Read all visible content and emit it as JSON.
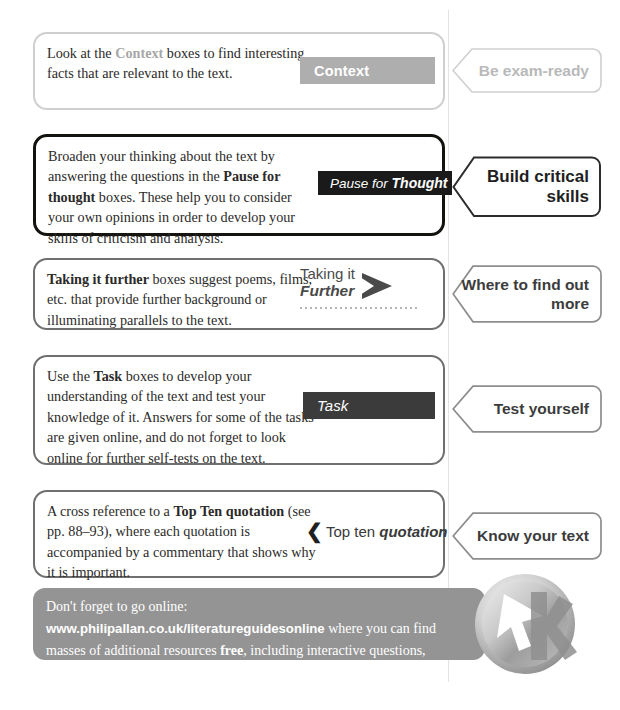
{
  "page": {
    "divider_color": "#e3e3e3",
    "accent_grey": "#aeaeae",
    "accent_dark": "#3b3b3b",
    "accent_black": "#1a1a1a"
  },
  "rows": [
    {
      "id": "context",
      "description_parts": {
        "lead": "Look at the ",
        "highlight": "Context",
        "rest": " boxes to find interesting facts that are relevant to the text."
      },
      "badge_label": "Context",
      "callout_label": "Be exam-ready"
    },
    {
      "id": "pause-for-thought",
      "description_parts": {
        "lead": "Broaden your thinking about the text by answering the questions in the ",
        "bold": "Pause for thought",
        "rest": " boxes. These help you to consider your own opinions in order to develop your skills of criticism and analysis."
      },
      "badge_label_regular": "Pause for",
      "badge_label_bold": "Thought",
      "badge_icon": "pause-icon",
      "callout_label": "Build critical skills"
    },
    {
      "id": "taking-it-further",
      "description_parts": {
        "bold": "Taking it further",
        "rest": " boxes suggest poems, films, etc. that provide further background or illuminating parallels to the text."
      },
      "badge_label_line1": "Taking it",
      "badge_label_line2": "Further",
      "badge_icon": "arrow-right-icon",
      "callout_label": "Where to find out more"
    },
    {
      "id": "task",
      "description_parts": {
        "lead": "Use the ",
        "bold": "Task",
        "rest": " boxes to develop your understanding of the text and test your knowledge of it. Answers for some of the tasks are given online, and do not forget to look online for further self-tests on the text."
      },
      "badge_label": "Task",
      "callout_label": "Test yourself"
    },
    {
      "id": "top-ten-quotation",
      "description_parts": {
        "lead": "A cross reference to a ",
        "bold": "Top Ten quotation",
        "rest": " (see pp. 88–93), where each quotation is accompanied by a commentary that shows why it is important."
      },
      "badge_chevron": "❮",
      "badge_label_regular": "Top ten",
      "badge_label_bold": "quotation",
      "callout_label": "Know your text"
    }
  ],
  "footer": {
    "lead": "Don't forget to go online: ",
    "url": "www.philipallan.co.uk/literatureguidesonline",
    "middle": " where you can find masses of additional resources ",
    "bold": "free",
    "tail": ", including interactive questions, podcasts, exam answers and a glossary.",
    "logo_name": "philip-allan-cursor-logo"
  }
}
